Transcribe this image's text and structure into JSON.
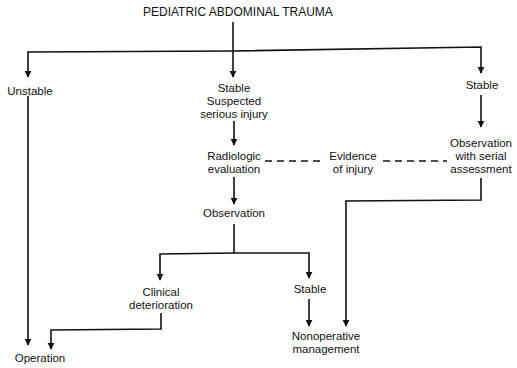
{
  "title": "PEDIATRIC ABDOMINAL TRAUMA",
  "nodes": {
    "unstable": [
      "Unstable"
    ],
    "stable_suspected": [
      "Stable",
      "Suspected",
      "serious injury"
    ],
    "stable_right": [
      "Stable"
    ],
    "radiologic": [
      "Radiologic",
      "evaluation"
    ],
    "evidence": [
      "Evidence",
      "of injury"
    ],
    "observation_serial": [
      "Observation",
      "with serial",
      "assessment"
    ],
    "observation": [
      "Observation"
    ],
    "clinical_det": [
      "Clinical",
      "deterioration"
    ],
    "stable_lower": [
      "Stable"
    ],
    "operation": [
      "Operation"
    ],
    "nonoperative": [
      "Nonoperative",
      "management"
    ]
  },
  "colors": {
    "line": "#111111",
    "text": "#111111",
    "background": "#ffffff"
  }
}
